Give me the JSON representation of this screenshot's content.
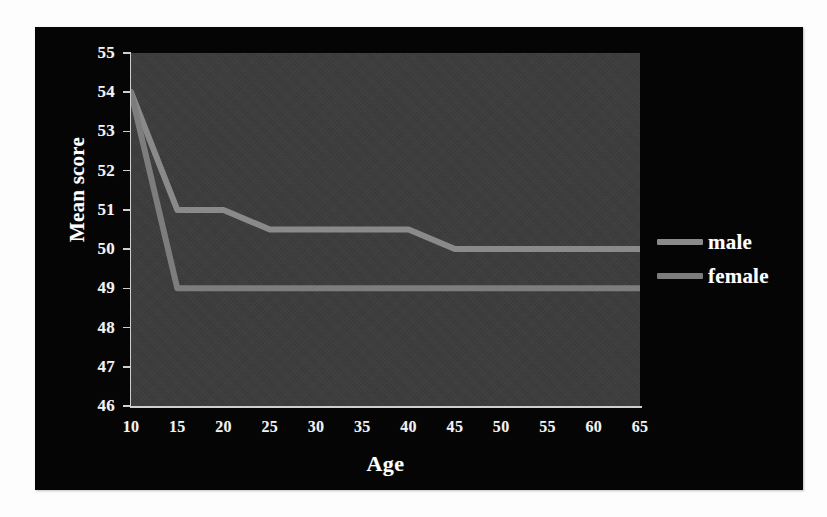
{
  "chart_data": {
    "type": "line",
    "title": "",
    "xlabel": "Age",
    "ylabel": "Mean score",
    "xlim": [
      10,
      65
    ],
    "ylim": [
      46,
      55
    ],
    "grid": false,
    "legend_position": "right",
    "x": [
      10,
      15,
      20,
      25,
      30,
      35,
      40,
      45,
      50,
      55,
      60,
      65
    ],
    "xticks": [
      "10",
      "15",
      "20",
      "25",
      "30",
      "35",
      "40",
      "45",
      "50",
      "55",
      "60",
      "65"
    ],
    "yticks": [
      "55",
      "54",
      "53",
      "52",
      "51",
      "50",
      "49",
      "48",
      "47",
      "46"
    ],
    "series": [
      {
        "name": "male",
        "color": "#8a8a8a",
        "values": [
          54,
          51,
          51,
          50.5,
          50.5,
          50.5,
          50.5,
          50,
          50,
          50,
          50,
          50
        ]
      },
      {
        "name": "female",
        "color": "#7d7d7d",
        "values": [
          54,
          49,
          49,
          49,
          49,
          49,
          49,
          49,
          49,
          49,
          49,
          49
        ]
      }
    ]
  },
  "axes": {
    "y_title": "Mean score",
    "x_title": "Age",
    "y_ticks": [
      "55",
      "54",
      "53",
      "52",
      "51",
      "50",
      "49",
      "48",
      "47",
      "46"
    ],
    "x_ticks": [
      "10",
      "15",
      "20",
      "25",
      "30",
      "35",
      "40",
      "45",
      "50",
      "55",
      "60",
      "65"
    ]
  },
  "legend": {
    "items": [
      {
        "label": "male",
        "color": "#8a8a8a"
      },
      {
        "label": "female",
        "color": "#7d7d7d"
      }
    ]
  },
  "colors": {
    "panel_background": "#050505",
    "plot_background": "#3b3b3b",
    "axis": "#cfcfcf",
    "text": "#ffffff",
    "page_background": "#ffffff"
  }
}
